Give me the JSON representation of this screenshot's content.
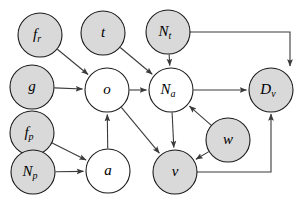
{
  "diagram": {
    "type": "directed-acyclic-graph",
    "title": "",
    "canvas": {
      "width": 306,
      "height": 199,
      "background": "#ffffff"
    },
    "style": {
      "shaded_fill": "#d9d9d9",
      "open_fill": "#ffffff",
      "node_stroke": "#1a1a1a",
      "edge_stroke": "#3b3b3b"
    },
    "nodes": [
      {
        "id": "f_r",
        "base": "f",
        "sub": "r",
        "cx": 40,
        "cy": 35,
        "r": 22,
        "shaded": true
      },
      {
        "id": "t",
        "base": "t",
        "sub": "",
        "cx": 103,
        "cy": 33,
        "r": 22,
        "shaded": true
      },
      {
        "id": "N_t",
        "base": "N",
        "sub": "t",
        "cx": 168,
        "cy": 32,
        "r": 22,
        "shaded": true
      },
      {
        "id": "g",
        "base": "g",
        "sub": "",
        "cx": 32,
        "cy": 87,
        "r": 22,
        "shaded": true
      },
      {
        "id": "o",
        "base": "o",
        "sub": "",
        "cx": 107,
        "cy": 90,
        "r": 22,
        "shaded": false
      },
      {
        "id": "N_a",
        "base": "N",
        "sub": "a",
        "cx": 171,
        "cy": 90,
        "r": 22,
        "shaded": false
      },
      {
        "id": "D_v",
        "base": "D",
        "sub": "v",
        "cx": 271,
        "cy": 90,
        "r": 22,
        "shaded": true
      },
      {
        "id": "f_p",
        "base": "f",
        "sub": "p",
        "cx": 32,
        "cy": 133,
        "r": 22,
        "shaded": true
      },
      {
        "id": "N_p",
        "base": "N",
        "sub": "p",
        "cx": 33,
        "cy": 172,
        "r": 22,
        "shaded": true
      },
      {
        "id": "a",
        "base": "a",
        "sub": "",
        "cx": 108,
        "cy": 171,
        "r": 22,
        "shaded": false
      },
      {
        "id": "v",
        "base": "v",
        "sub": "",
        "cx": 175,
        "cy": 172,
        "r": 22,
        "shaded": true
      },
      {
        "id": "w",
        "base": "w",
        "sub": "",
        "cx": 228,
        "cy": 140,
        "r": 22,
        "shaded": true
      }
    ],
    "edges": [
      {
        "from": "f_r",
        "to": "o",
        "route": "straight"
      },
      {
        "from": "g",
        "to": "o",
        "route": "straight"
      },
      {
        "from": "a",
        "to": "o",
        "route": "straight"
      },
      {
        "from": "t",
        "to": "N_a",
        "route": "straight"
      },
      {
        "from": "N_t",
        "to": "N_a",
        "route": "straight"
      },
      {
        "from": "o",
        "to": "N_a",
        "route": "straight"
      },
      {
        "from": "w",
        "to": "N_a",
        "route": "straight"
      },
      {
        "from": "o",
        "to": "v",
        "route": "straight"
      },
      {
        "from": "N_a",
        "to": "v",
        "route": "straight"
      },
      {
        "from": "w",
        "to": "v",
        "route": "straight"
      },
      {
        "from": "f_p",
        "to": "a",
        "route": "straight"
      },
      {
        "from": "N_p",
        "to": "a",
        "route": "straight"
      },
      {
        "from": "N_a",
        "to": "D_v",
        "route": "straight"
      },
      {
        "from": "N_t",
        "to": "D_v",
        "route": "orthogonal-right-down",
        "waypoint_x": 290
      },
      {
        "from": "v",
        "to": "D_v",
        "route": "orthogonal-right-up",
        "waypoint_x": 271
      }
    ]
  }
}
